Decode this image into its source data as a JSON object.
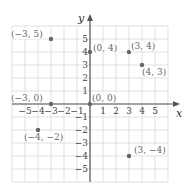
{
  "chart_data": {
    "type": "scatter",
    "title": "",
    "xlabel": "x",
    "ylabel": "y",
    "xlim": [
      -5,
      5
    ],
    "ylim": [
      -5,
      5
    ],
    "grid": true,
    "x_ticks": [
      "-5",
      "-4",
      "-3",
      "-2",
      "-1",
      "1",
      "2",
      "3",
      "4",
      "5"
    ],
    "y_ticks": [
      "5",
      "4",
      "3",
      "2",
      "1",
      "-1",
      "-2",
      "-3",
      "-4",
      "-5"
    ],
    "points": [
      {
        "x": -3,
        "y": 5,
        "label": "(−3, 5)"
      },
      {
        "x": 0,
        "y": 4,
        "label": "(0, 4)"
      },
      {
        "x": 3,
        "y": 4,
        "label": "(3, 4)"
      },
      {
        "x": 4,
        "y": 3,
        "label": "(4, 3)"
      },
      {
        "x": -3,
        "y": 0,
        "label": "(−3, 0)"
      },
      {
        "x": 0,
        "y": 0,
        "label": "(0, 0)"
      },
      {
        "x": -4,
        "y": -2,
        "label": "(−4, −2)"
      },
      {
        "x": 3,
        "y": -4,
        "label": "(3, −4)"
      }
    ]
  },
  "colors": {
    "grid": "#d9d9d9",
    "axis": "#555555",
    "point": "#666666",
    "label": "#777777"
  }
}
